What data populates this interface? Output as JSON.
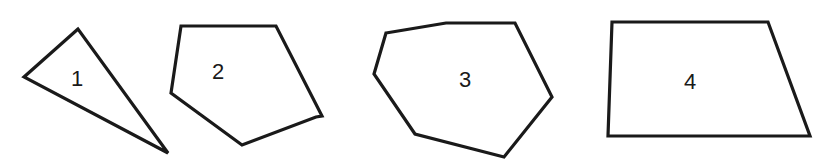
{
  "diagram": {
    "type": "polygons",
    "background": "#ffffff",
    "stroke_color": "#1a1a1a",
    "shapes": [
      {
        "label": "1",
        "kind": "triangle",
        "points": "78,29 24,77 168,153",
        "label_pos": [
          77,
          80
        ]
      },
      {
        "label": "2",
        "kind": "pentagon",
        "points": "181,26 276,26 322,116 316,117 242,145 171,93",
        "label_pos": [
          218,
          73
        ]
      },
      {
        "label": "3",
        "kind": "heptagon",
        "points": "386,33 446,23 515,23 552,97 504,157 415,134 374,74",
        "label_pos": [
          465,
          81
        ]
      },
      {
        "label": "4",
        "kind": "trapezoid",
        "points": "612,22 768,22 810,136 608,136",
        "label_pos": [
          690,
          83
        ]
      }
    ]
  }
}
